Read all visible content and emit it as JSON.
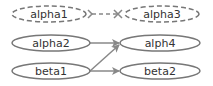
{
  "diagram": {
    "nodes": [
      {
        "id": "alpha1",
        "label": "alpha1",
        "style": "dashed",
        "cx": 49,
        "cy": 14,
        "rx": 37,
        "ry": 8
      },
      {
        "id": "alpha3",
        "label": "alpha3",
        "style": "dashed",
        "cx": 162,
        "cy": 14,
        "rx": 37,
        "ry": 8
      },
      {
        "id": "alpha2",
        "label": "alpha2",
        "style": "solid",
        "cx": 51,
        "cy": 43,
        "rx": 39,
        "ry": 8
      },
      {
        "id": "alph4",
        "label": "alph4",
        "style": "solid",
        "cx": 160,
        "cy": 43,
        "rx": 40,
        "ry": 8
      },
      {
        "id": "beta1",
        "label": "beta1",
        "style": "solid",
        "cx": 51,
        "cy": 71,
        "rx": 39,
        "ry": 8
      },
      {
        "id": "beta2",
        "label": "beta2",
        "style": "solid",
        "cx": 160,
        "cy": 71,
        "rx": 40,
        "ry": 8
      }
    ],
    "edges": [
      {
        "from": "alpha1",
        "to": "alpha3",
        "style": "dashed",
        "arrow": "tee-both"
      },
      {
        "from": "alpha2",
        "to": "alph4",
        "style": "solid",
        "arrow": "normal"
      },
      {
        "from": "beta1",
        "to": "alph4",
        "style": "solid",
        "arrow": "normal"
      },
      {
        "from": "beta1",
        "to": "beta2",
        "style": "solid",
        "arrow": "normal"
      }
    ],
    "colors": {
      "stroke": "#777777",
      "edge": "#888888",
      "text": "#333333",
      "background": "#ffffff"
    }
  }
}
